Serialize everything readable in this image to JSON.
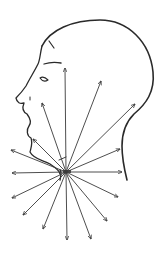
{
  "figure": {
    "subject": "Head profile with sound radiating from larynx",
    "stroke_color": "#333333",
    "background": "#ffffff",
    "origin": {
      "x": 66,
      "y": 172
    },
    "arrows": [
      {
        "x": 65,
        "y": 68
      },
      {
        "x": 101,
        "y": 81
      },
      {
        "x": 135,
        "y": 104
      },
      {
        "x": 120,
        "y": 149
      },
      {
        "x": 122,
        "y": 172
      },
      {
        "x": 118,
        "y": 197
      },
      {
        "x": 107,
        "y": 221
      },
      {
        "x": 91,
        "y": 239
      },
      {
        "x": 67,
        "y": 240
      },
      {
        "x": 43,
        "y": 229
      },
      {
        "x": 23,
        "y": 215
      },
      {
        "x": 12,
        "y": 198
      },
      {
        "x": 12,
        "y": 173
      },
      {
        "x": 11,
        "y": 150
      },
      {
        "x": 33,
        "y": 139
      },
      {
        "x": 42,
        "y": 103
      }
    ]
  }
}
